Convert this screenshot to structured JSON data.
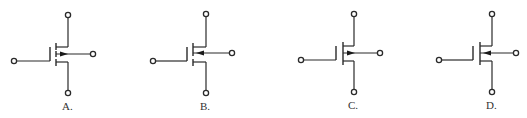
{
  "diagram": {
    "colors": {
      "line": "#2a2a2a",
      "background": "#ffffff",
      "label": "#333333"
    },
    "options": [
      {
        "label": "A.",
        "channel": "dashed",
        "substrate_arrow": "outward",
        "geometry": {
          "gateX": 14,
          "gateY": 61,
          "plateX": 50,
          "plateTop": 47,
          "chanX": 56,
          "chanTop": 43,
          "chanBot": 66,
          "leadX": 68,
          "drainY": 15,
          "sourceY": 93,
          "subY": 54,
          "subTermX": 93,
          "labelX": 62,
          "labelY": 110
        }
      },
      {
        "label": "B.",
        "channel": "dashed",
        "substrate_arrow": "inward",
        "geometry": {
          "gateX": 153,
          "gateY": 61,
          "plateX": 187,
          "plateTop": 47,
          "chanX": 193,
          "chanTop": 43,
          "chanBot": 66,
          "leadX": 206,
          "drainY": 14,
          "sourceY": 93,
          "subY": 53,
          "subTermX": 232,
          "labelX": 200,
          "labelY": 110
        }
      },
      {
        "label": "C.",
        "channel": "solid",
        "substrate_arrow": "outward",
        "geometry": {
          "gateX": 301,
          "gateY": 60,
          "plateX": 336,
          "plateTop": 46,
          "chanX": 343,
          "chanTop": 42,
          "chanBot": 65,
          "leadX": 354,
          "drainY": 14,
          "sourceY": 92,
          "subY": 53,
          "subTermX": 380,
          "labelX": 348,
          "labelY": 109
        }
      },
      {
        "label": "D.",
        "channel": "solid",
        "substrate_arrow": "inward",
        "geometry": {
          "gateX": 439,
          "gateY": 60,
          "plateX": 473,
          "plateTop": 46,
          "chanX": 480,
          "chanTop": 42,
          "chanBot": 65,
          "leadX": 492,
          "drainY": 14,
          "sourceY": 92,
          "subY": 53,
          "subTermX": 516,
          "labelX": 486,
          "labelY": 109
        }
      }
    ]
  }
}
